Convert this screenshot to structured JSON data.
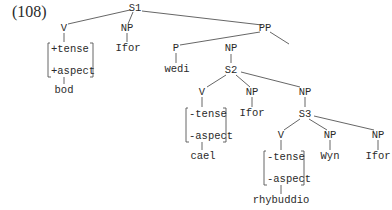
{
  "example_number": "(108)",
  "labels": {
    "S1": "S1",
    "V1": "V",
    "NP1": "NP",
    "PP": "PP",
    "feat1a": "+tense",
    "feat1b": "+aspect",
    "bod": "bod",
    "Ifor1": "Ifor",
    "P": "P",
    "NP2": "NP",
    "wedi": "wedi",
    "S2": "S2",
    "V2": "V",
    "NP3": "NP",
    "NP4": "NP",
    "feat2a": "-tense",
    "feat2b": "-aspect",
    "cael": "cael",
    "Ifor2": "Ifor",
    "S3": "S3",
    "V3": "V",
    "NP5": "NP",
    "NP6": "NP",
    "feat3a": "-tense",
    "feat3b": "-aspect",
    "rhybuddio": "rhybuddio",
    "Wyn": "Wyn",
    "Ifor3": "Ifor"
  },
  "colors": {
    "ink": "#2a2a2a",
    "line": "#555555",
    "background": "#ffffff"
  }
}
